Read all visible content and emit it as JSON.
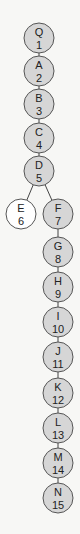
{
  "diagram": {
    "type": "tree",
    "colors": {
      "filled": "#d6d6d6",
      "unfilled": "#ffffff",
      "stroke": "#555555",
      "edge": "#444444"
    },
    "nodes": [
      {
        "id": "Q",
        "letter": "Q",
        "number": "1",
        "x": 39,
        "y": 38,
        "filled": true
      },
      {
        "id": "A",
        "letter": "A",
        "number": "2",
        "x": 39,
        "y": 71,
        "filled": true
      },
      {
        "id": "B",
        "letter": "B",
        "number": "3",
        "x": 39,
        "y": 104,
        "filled": true
      },
      {
        "id": "C",
        "letter": "C",
        "number": "4",
        "x": 39,
        "y": 138,
        "filled": true
      },
      {
        "id": "D",
        "letter": "D",
        "number": "5",
        "x": 39,
        "y": 171,
        "filled": true
      },
      {
        "id": "E",
        "letter": "E",
        "number": "6",
        "x": 21,
        "y": 214,
        "filled": false
      },
      {
        "id": "F",
        "letter": "F",
        "number": "7",
        "x": 58,
        "y": 214,
        "filled": true
      },
      {
        "id": "G",
        "letter": "G",
        "number": "8",
        "x": 58,
        "y": 252,
        "filled": true
      },
      {
        "id": "H",
        "letter": "H",
        "number": "9",
        "x": 58,
        "y": 285,
        "filled": true
      },
      {
        "id": "I",
        "letter": "I",
        "number": "10",
        "x": 58,
        "y": 318,
        "filled": true
      },
      {
        "id": "J",
        "letter": "J",
        "number": "11",
        "x": 58,
        "y": 351,
        "filled": true
      },
      {
        "id": "K",
        "letter": "K",
        "number": "12",
        "x": 58,
        "y": 384,
        "filled": true
      },
      {
        "id": "L",
        "letter": "L",
        "number": "13",
        "x": 58,
        "y": 417,
        "filled": true
      },
      {
        "id": "M",
        "letter": "M",
        "number": "14",
        "x": 58,
        "y": 465,
        "filled": true
      },
      {
        "id": "N",
        "letter": "N",
        "number": "15",
        "x": 58,
        "y": 498,
        "filled": true
      }
    ],
    "edges": [
      [
        "Q",
        "A"
      ],
      [
        "A",
        "B"
      ],
      [
        "B",
        "C"
      ],
      [
        "C",
        "D"
      ],
      [
        "D",
        "E"
      ],
      [
        "D",
        "F"
      ],
      [
        "F",
        "G"
      ],
      [
        "G",
        "H"
      ],
      [
        "H",
        "I"
      ],
      [
        "I",
        "J"
      ],
      [
        "J",
        "K"
      ],
      [
        "K",
        "L"
      ],
      [
        "L",
        "M"
      ],
      [
        "M",
        "N"
      ]
    ]
  }
}
